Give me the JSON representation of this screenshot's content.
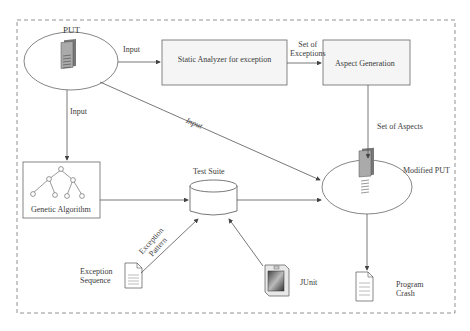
{
  "nodes": {
    "put": {
      "label": "PUT"
    },
    "static_analyzer": {
      "label": "Static Analyzer for exception"
    },
    "aspect_generation": {
      "label": "Aspect Generation"
    },
    "genetic_algorithm": {
      "label": "Genetic Algorithm"
    },
    "test_suite": {
      "label": "Test Suite"
    },
    "modified_put": {
      "label": "Modified PUT"
    },
    "exception_sequence": {
      "label_line1": "Exception",
      "label_line2": "Sequence"
    },
    "junit": {
      "label": "JUnit"
    },
    "program_crash": {
      "label_line1": "Program",
      "label_line2": "Crash"
    }
  },
  "edges": {
    "put_to_analyzer": {
      "label": "Input"
    },
    "analyzer_to_aspect": {
      "label_line1": "Set of",
      "label_line2": "Exceptions"
    },
    "put_to_ga": {
      "label": "Input"
    },
    "put_to_modified": {
      "label": "Input"
    },
    "aspect_to_modified": {
      "label": "Set of Aspects"
    },
    "exception_pattern": {
      "label_line1": "Exception",
      "label_line2": "Pattern"
    }
  },
  "colors": {
    "line": "#555555",
    "box_fill": "#f4f4f4",
    "border_dashed": "#777777"
  }
}
